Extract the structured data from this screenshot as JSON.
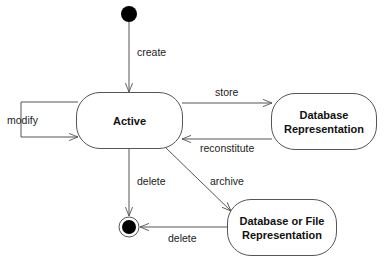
{
  "diagram": {
    "type": "UML state diagram",
    "states": [
      {
        "id": "active",
        "label": "Active"
      },
      {
        "id": "db",
        "label_line1": "Database",
        "label_line2": "Representation"
      },
      {
        "id": "dbfile",
        "label_line1": "Database or File",
        "label_line2": "Representation"
      }
    ],
    "transitions": {
      "create": "create",
      "modify": "modify",
      "store": "store",
      "reconstitute": "reconstitute",
      "delete_active": "delete",
      "archive": "archive",
      "delete_dbfile": "delete"
    },
    "colors": {
      "line": "#555555",
      "node": "#000000"
    }
  }
}
